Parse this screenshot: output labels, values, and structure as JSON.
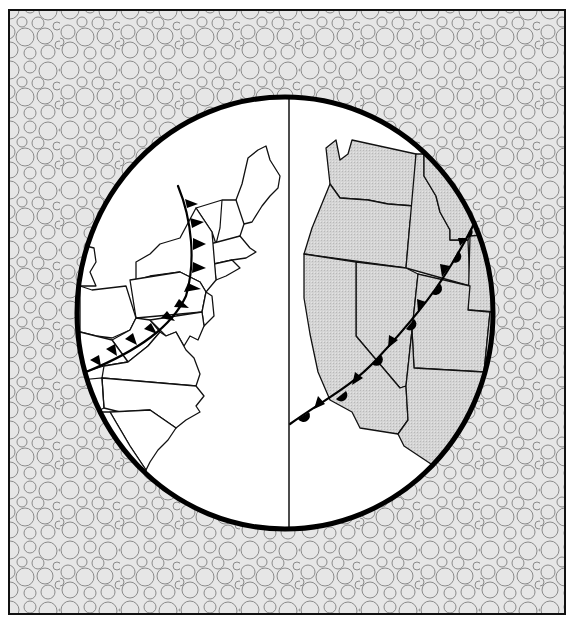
{
  "figure": {
    "title": "",
    "description": "Illustration of weather fronts over the United States seen through a circular lens, split into eastern and western halves",
    "colors": {
      "background_fill": "#e6e6e6",
      "bubble_stroke": "#8a8a8a",
      "frame": "#111111",
      "land_east": "#ffffff",
      "land_west": "#d2d2d2",
      "front": "#000000"
    }
  },
  "panels": [
    {
      "id": "east",
      "label": "",
      "region": "Northeastern and Mid-Atlantic United States",
      "front_type": "cold-front",
      "front_symbols": "triangles"
    },
    {
      "id": "west",
      "label": "",
      "region": "Western United States (Pacific Northwest to Southwest)",
      "front_type": "occluded-front",
      "front_symbols": "alternating triangles and semicircles"
    }
  ]
}
